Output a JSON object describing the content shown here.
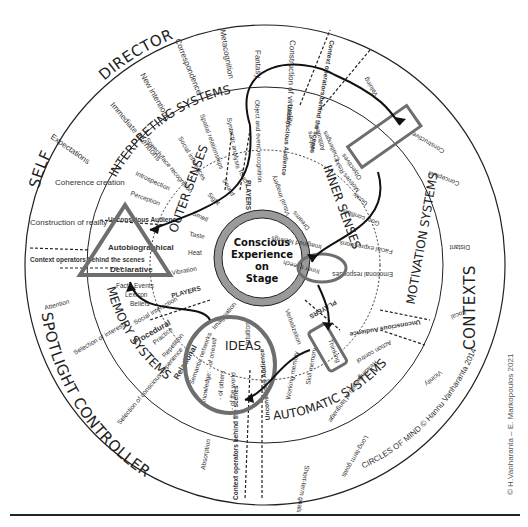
{
  "center": {
    "line1": "Conscious",
    "line2": "Experience",
    "line3": "on",
    "line4": "Stage"
  },
  "outer_ring": {
    "self": "SELF",
    "director": "DIRECTOR",
    "contexts": "CONTEXTS",
    "spotlight_controller": "SPOTLIGHT CONTROLLER",
    "circles_of_mind": "CIRCLES OF MIND © Hannu Vanharanta 2014",
    "self_items": [
      "Expectations",
      "Coherence creation",
      "Construction of reality"
    ],
    "director_items": [
      "Immediate intentions",
      "New intentions",
      "Correspondence",
      "Metacognition",
      "Fantasy",
      "Construction of virtuality"
    ],
    "context_operators_top": "Context operators behind the scenes",
    "context_operators_left": "Context operators behind the scenes",
    "context_operators_bottom": "Context operators behind the scenes",
    "context_items": [
      "Valuing",
      "Constructive",
      "Conceptual",
      "Distant",
      "Local",
      "Vicinity",
      "Long-term goals",
      "Short-term goals"
    ],
    "spotlight_items": [
      "Attention",
      "Selection of interests",
      "Selection of conscious experience",
      "Absorption"
    ]
  },
  "middle_ring": {
    "interpreting_systems": "INTERPRETING SYSTEMS",
    "motivation_systems": "MOTIVATION SYSTEMS",
    "automatic_systems": "AUTOMATIC SYSTEMS",
    "memory_systems": "MEMORY SYSTEMS",
    "interpreting_items": [
      "Perception",
      "Introspection",
      "Speech/face recognition",
      "Social inferences",
      "Spatial relationships",
      "Syntactic analysis",
      "Object and event recognition"
    ],
    "unconscious_audience": "Unconscious Audience",
    "motivation_items": [
      "Values",
      "Attitudes",
      "Challenges",
      "Risks",
      "Objectives",
      "Motives",
      "Goals",
      "Goal conflicts",
      "Facial expressions",
      "Emotional responses"
    ],
    "automatic_items": [
      "Action control",
      "Reading",
      "Details of language",
      "Skill memory",
      "Working memory"
    ],
    "memory_items": [
      "Autobiographical",
      "Declarative",
      "Facts",
      "Events",
      "Lexicon",
      "Beliefs",
      "Social interaction",
      "Procedural",
      "Practice",
      "Repetition",
      "Relational",
      "Semantic networks",
      "Knowledge: - of oneself",
      "- of others",
      "- of the world"
    ]
  },
  "inner_ring": {
    "outer_senses": "OUTER SENSES",
    "inner_senses": "INNER SENSES",
    "ideas": "IDEAS",
    "players": "PLAYERS",
    "outer_items": [
      "Touch",
      "Sound",
      "Sight",
      "Smell",
      "Taste",
      "Heat",
      "Vibration"
    ],
    "inner_items": [
      "Visual imagery",
      "Dreams",
      "Imagined feelings",
      "Inner speech"
    ],
    "ideas_items": [
      "Imagination",
      "Intuition",
      "Verbalization",
      "Thinking"
    ]
  },
  "highlights": {
    "triangle_color": "#6e6e6e",
    "circle_color": "#6e6e6e",
    "box_color": "#6e6e6e",
    "ring_fill": "#9a9a9a"
  },
  "credit": "© H.Vanharanta – E. Markopoulos 2021"
}
